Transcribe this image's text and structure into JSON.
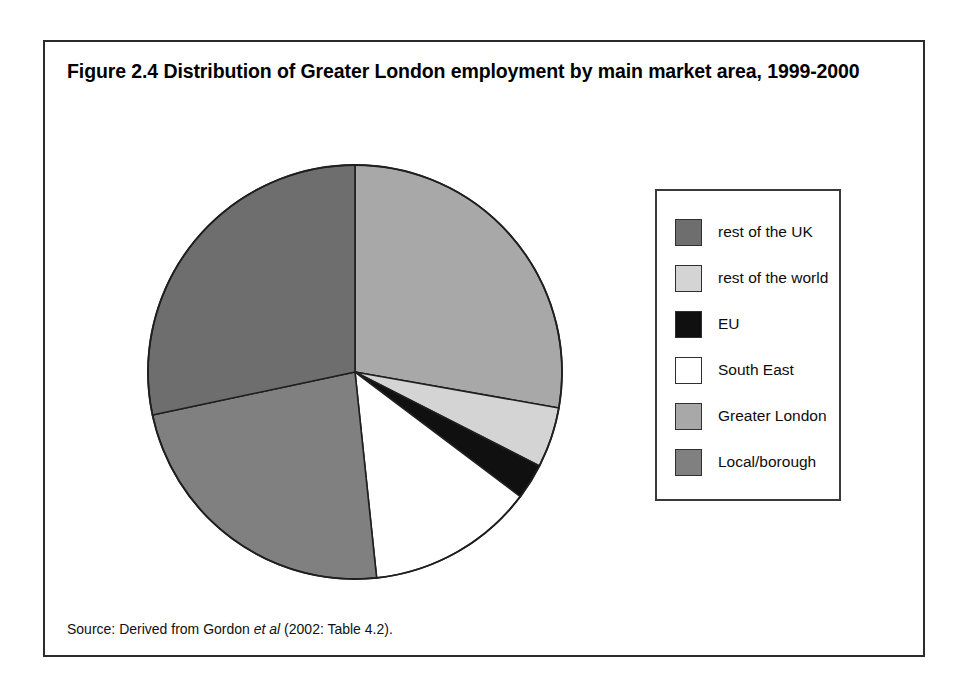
{
  "figure": {
    "title": "Figure 2.4 Distribution of Greater London employment by main market area, 1999-2000",
    "source_prefix": "Source: Derived from Gordon ",
    "source_italic": "et al",
    "source_suffix": " (2002: Table 4.2)."
  },
  "legend": {
    "items": [
      {
        "label": "rest of the UK",
        "color": "#6e6e6e"
      },
      {
        "label": "rest of the world",
        "color": "#d4d4d4"
      },
      {
        "label": "EU",
        "color": "#101010"
      },
      {
        "label": "South East",
        "color": "#ffffff"
      },
      {
        "label": "Greater London",
        "color": "#a8a8a8"
      },
      {
        "label": "Local/borough",
        "color": "#808080"
      }
    ]
  },
  "chart_data": {
    "type": "pie",
    "title": "Figure 2.4 Distribution of Greater London employment by main market area, 1999-2000",
    "xlabel": "",
    "ylabel": "",
    "legend_position": "right",
    "grid": false,
    "start_angle_deg": 0,
    "direction": "clockwise",
    "center": {
      "x": 310,
      "y": 330
    },
    "radius": 207,
    "slices": [
      {
        "label": "Greater London",
        "percent": 27.8,
        "angle_deg": 100,
        "color": "#a8a8a8"
      },
      {
        "label": "rest of the world",
        "percent": 4.7,
        "angle_deg": 17,
        "color": "#d4d4d4"
      },
      {
        "label": "EU",
        "percent": 2.8,
        "angle_deg": 10,
        "color": "#101010"
      },
      {
        "label": "South East",
        "percent": 13.1,
        "angle_deg": 47,
        "color": "#ffffff"
      },
      {
        "label": "Local/borough",
        "percent": 23.3,
        "angle_deg": 84,
        "color": "#808080"
      },
      {
        "label": "rest of the UK",
        "percent": 28.3,
        "angle_deg": 102,
        "color": "#6e6e6e"
      }
    ],
    "categories": [
      "Greater London",
      "rest of the world",
      "EU",
      "South East",
      "Local/borough",
      "rest of the UK"
    ],
    "values": [
      27.8,
      4.7,
      2.8,
      13.1,
      23.3,
      28.3
    ]
  }
}
